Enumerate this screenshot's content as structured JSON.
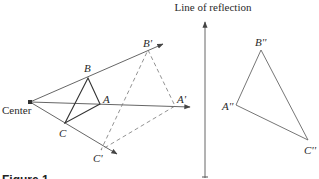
{
  "diagram": {
    "type": "geometric-transformation",
    "title": "Line of reflection",
    "caption": "Figure 1",
    "center_label": "Center",
    "original_triangle": {
      "A": {
        "label": "A",
        "x": 100,
        "y": 104
      },
      "B": {
        "label": "B",
        "x": 88,
        "y": 78
      },
      "C": {
        "label": "C",
        "x": 65,
        "y": 123
      }
    },
    "dilated_triangle": {
      "A": {
        "label": "A'",
        "x": 175,
        "y": 106
      },
      "B": {
        "label": "B'",
        "x": 148,
        "y": 50
      },
      "C": {
        "label": "C'",
        "x": 101,
        "y": 150
      }
    },
    "reflected_triangle": {
      "A": {
        "label": "A''",
        "x": 236,
        "y": 105
      },
      "B": {
        "label": "B''",
        "x": 261,
        "y": 50
      },
      "C": {
        "label": "C''",
        "x": 308,
        "y": 140
      }
    },
    "center_point": {
      "x": 30,
      "y": 102
    },
    "reflection_line_x": 205,
    "colors": {
      "line": "#555555",
      "text": "#2a2a2a",
      "dashed": "#777777"
    }
  }
}
